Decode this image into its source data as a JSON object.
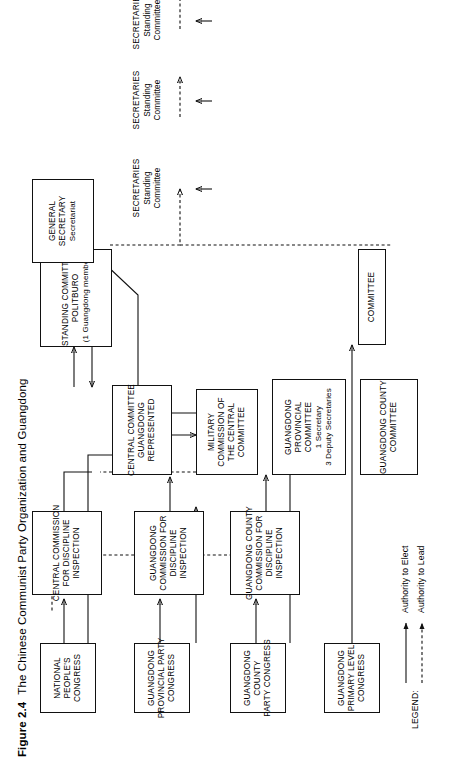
{
  "figure": {
    "number": "Figure 2.4",
    "title": "The Chinese Communist Party Organization and Guangdong"
  },
  "nodes": {
    "general_secretary": {
      "l1": "GENERAL",
      "l2": "SECRETARY",
      "l3": "Secretariat"
    },
    "standing_committee": {
      "l1": "STANDING COMMITTEE",
      "l2": "POLITBURO",
      "l3": "(1 Guangdong member)"
    },
    "central_committee": {
      "l1": "CENTRAL COMMITTEE",
      "l2": "GUANGDONG",
      "l3": "REPRESENTED"
    },
    "military_commission": {
      "l1": "MILITARY",
      "l2": "COMMISSION OF",
      "l3": "THE CENTRAL",
      "l4": "COMMITTEE"
    },
    "central_cdi": {
      "l1": "CENTRAL COMMISSION",
      "l2": "FOR DISCIPLINE",
      "l3": "INSPECTION"
    },
    "national_peoples_congress": {
      "l1": "NATIONAL",
      "l2": "PEOPLE'S",
      "l3": "CONGRESS"
    },
    "gd_provincial_committee": {
      "l1": "GUANGDONG",
      "l2": "PROVINCIAL",
      "l3": "COMMITTEE",
      "l4": "1 Secretary",
      "l5": "3 Deputy Secretaries"
    },
    "gd_secretaries": {
      "l1": "SECRETARIES",
      "l2": "Standing",
      "l3": "Committee"
    },
    "gd_cdi": {
      "l1": "GUANGDONG",
      "l2": "COMMISSION FOR",
      "l3": "DISCIPLINE",
      "l4": "INSPECTION"
    },
    "gd_provincial_party_congress": {
      "l1": "GUANGDONG",
      "l2": "PROVINCIAL PARTY",
      "l3": "CONGRESS"
    },
    "gd_county_committee": {
      "l1": "GUANGDONG COUNTY",
      "l2": "COMMITTEE"
    },
    "county_secretaries": {
      "l1": "SECRETARIES",
      "l2": "Standing",
      "l3": "Committee"
    },
    "gd_county_cdi": {
      "l1": "GUANGDONG COUNTY",
      "l2": "COMMISSION FOR",
      "l3": "DISCIPLINE",
      "l4": "INSPECTION"
    },
    "gd_county_party_congress": {
      "l1": "GUANGDONG",
      "l2": "COUNTY",
      "l3": "PARTY CONGRESS"
    },
    "primary_committee": {
      "l1": "COMMITTEE"
    },
    "primary_secretaries": {
      "l1": "SECRETARIES",
      "l2": "Standing",
      "l3": "Committee"
    },
    "gd_primary_level_congress": {
      "l1": "GUANGDONG",
      "l2": "PRIMARY LEVEL",
      "l3": "CONGRESS"
    }
  },
  "legend": {
    "title": "LEGEND:",
    "elect": "Authority to Elect",
    "lead": "Authority to Lead"
  },
  "colors": {
    "ink": "#111111",
    "paper": "#ffffff"
  }
}
